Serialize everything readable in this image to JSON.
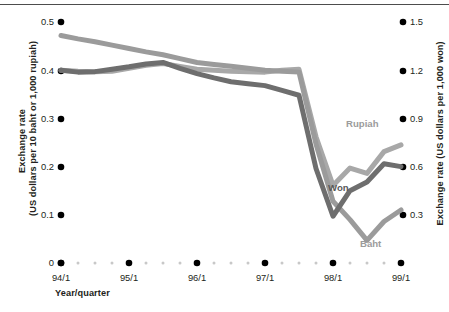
{
  "chart_data": {
    "type": "line",
    "title": "",
    "xlabel": "Year/quarter",
    "ylabel": "Exchange rate (US dollars per 10 baht or 1,000 rupiah)",
    "ylabel_right": "Exchange rate (US dollars per 1,000 won)",
    "x": [
      "94/1",
      "94/2",
      "94/3",
      "94/4",
      "95/1",
      "95/2",
      "95/3",
      "95/4",
      "96/1",
      "96/2",
      "96/3",
      "96/4",
      "97/1",
      "97/2",
      "97/3",
      "97/4",
      "98/1",
      "98/2",
      "98/3",
      "98/4",
      "99/1"
    ],
    "xticks": [
      "94/1",
      "95/1",
      "96/1",
      "97/1",
      "98/1",
      "99/1"
    ],
    "yticks_left": [
      "0",
      "0.1",
      "0.2",
      "0.3",
      "0.4",
      "0.5"
    ],
    "yticks_right": [
      "0.3",
      "0.6",
      "0.9",
      "1.2",
      "1.5"
    ],
    "ylim_left": [
      0,
      0.5
    ],
    "ylim_right": [
      0.3,
      1.5
    ],
    "grid": false,
    "legend_position": "inline-annotations",
    "series": [
      {
        "name": "Baht",
        "color": "#9b9b9b",
        "axis": "left",
        "values": [
          0.472,
          0.465,
          0.459,
          0.452,
          0.445,
          0.438,
          0.432,
          0.424,
          0.416,
          0.412,
          0.408,
          0.404,
          0.4,
          0.398,
          0.396,
          0.247,
          0.128,
          0.09,
          0.047,
          0.086,
          0.11
        ]
      },
      {
        "name": "Won",
        "color": "#6e6e6e",
        "axis": "right",
        "values": [
          0.4,
          0.396,
          0.397,
          0.402,
          0.407,
          0.413,
          0.416,
          0.404,
          0.393,
          0.384,
          0.376,
          0.372,
          0.368,
          0.358,
          0.348,
          0.196,
          0.097,
          0.15,
          0.168,
          0.206,
          0.2
        ]
      },
      {
        "name": "Rupiah",
        "color": "#a8a8a8",
        "axis": "left",
        "values": [
          0.4,
          0.398,
          0.397,
          0.398,
          0.404,
          0.41,
          0.414,
          0.408,
          0.402,
          0.4,
          0.398,
          0.397,
          0.396,
          0.4,
          0.402,
          0.262,
          0.161,
          0.197,
          0.186,
          0.231,
          0.245
        ]
      }
    ],
    "annotations": [
      {
        "text": "Rupiah",
        "x_px": 346,
        "y_px": 118,
        "color": "#9b9b9b"
      },
      {
        "text": "Won",
        "x_px": 328,
        "y_px": 182,
        "color": "#595959"
      },
      {
        "text": "Baht",
        "x_px": 360,
        "y_px": 238,
        "color": "#9b9b9b"
      }
    ]
  },
  "axes": {
    "left_title": "Exchange rate\n(US dollars per 10 baht or 1,000 rupiah)",
    "left_title_line1": "Exchange rate",
    "left_title_line2": "(US dollars per 10 baht or 1,000 rupiah)",
    "right_title": "Exchange rate (US dollars per 1,000 won)",
    "x_title": "Year/quarter"
  },
  "tick_labels": {
    "left": [
      {
        "text": "0.5",
        "y_px": 22
      },
      {
        "text": "0.4",
        "y_px": 71
      },
      {
        "text": "0.3",
        "y_px": 119
      },
      {
        "text": "0.2",
        "y_px": 167
      },
      {
        "text": "0.1",
        "y_px": 215
      },
      {
        "text": "0",
        "y_px": 263
      }
    ],
    "right": [
      {
        "text": "1.5",
        "y_px": 22
      },
      {
        "text": "1.2",
        "y_px": 71
      },
      {
        "text": "0.9",
        "y_px": 119
      },
      {
        "text": "0.6",
        "y_px": 167
      },
      {
        "text": "0.3",
        "y_px": 215
      }
    ],
    "bottom": [
      {
        "text": "94/1",
        "x_px": 61
      },
      {
        "text": "95/1",
        "x_px": 129
      },
      {
        "text": "96/1",
        "x_px": 197
      },
      {
        "text": "97/1",
        "x_px": 265
      },
      {
        "text": "98/1",
        "x_px": 333
      },
      {
        "text": "99/1",
        "x_px": 401
      }
    ]
  },
  "colors": {
    "baht": "#9b9b9b",
    "won": "#6e6e6e",
    "rupiah": "#a8a8a8",
    "tick_dot": "#000000",
    "minor_dot": "#c8c8c8",
    "text": "#231f20",
    "rule": "#4d4d4d"
  }
}
